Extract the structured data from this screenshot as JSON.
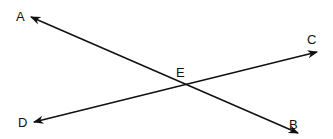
{
  "diagram": {
    "type": "intersecting-lines",
    "points": {
      "A": {
        "label": "A",
        "x": 22,
        "y": 20
      },
      "B": {
        "label": "B",
        "x": 295,
        "y": 128
      },
      "C": {
        "label": "C",
        "x": 313,
        "y": 44
      },
      "D": {
        "label": "D",
        "x": 24,
        "y": 126
      },
      "E": {
        "label": "E",
        "x": 182,
        "y": 76
      }
    },
    "lines": [
      {
        "name": "line-AB",
        "from": "A",
        "to": "B",
        "arrows": "both"
      },
      {
        "name": "line-CD",
        "from": "C",
        "to": "D",
        "arrows": "both"
      }
    ],
    "intersection": "E",
    "stroke_color": "#111111"
  }
}
